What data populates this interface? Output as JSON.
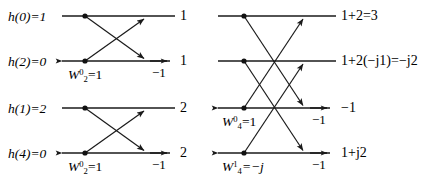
{
  "figure": {
    "stroke_color": "#1a1a1a",
    "text_color": "#000000",
    "background": "#ffffff"
  },
  "inputs": [
    {
      "id": "in-h0",
      "label": "h(0)=1",
      "name": "h(0)",
      "value": "1",
      "row": 1
    },
    {
      "id": "in-h2",
      "label": "h(2)=0",
      "name": "h(2)",
      "value": "0",
      "row": 2
    },
    {
      "id": "in-h1",
      "label": "h(1)=2",
      "name": "h(1)",
      "value": "2",
      "row": 3
    },
    {
      "id": "in-h4",
      "label": "h(4)=0",
      "name": "h(4)",
      "value": "0",
      "row": 4
    }
  ],
  "stage1": {
    "outputs": [
      {
        "id": "s1-out-1",
        "label": "1",
        "row": 1
      },
      {
        "id": "s1-out-2",
        "label": "1",
        "row": 2
      },
      {
        "id": "s1-out-3",
        "label": "2",
        "row": 3
      },
      {
        "id": "s1-out-4",
        "label": "2",
        "row": 4
      }
    ],
    "negative_labels": [
      {
        "id": "s1-neg-row2",
        "label": "−1",
        "row": 2
      },
      {
        "id": "s1-neg-row4",
        "label": "−1",
        "row": 4
      }
    ],
    "twiddles": [
      {
        "id": "s1-tw-row2",
        "base": "W",
        "sub": "2",
        "sup": "0",
        "equals": "=1",
        "row": 2
      },
      {
        "id": "s1-tw-row4",
        "base": "W",
        "sub": "2",
        "sup": "0",
        "equals": "=1",
        "row": 4
      }
    ]
  },
  "stage2": {
    "outputs": [
      {
        "id": "s2-out-1",
        "label": "1+2=3",
        "row": 1
      },
      {
        "id": "s2-out-2",
        "label": "1+2(−j1)=−j2",
        "row": 2
      },
      {
        "id": "s2-out-3",
        "label": "−1",
        "row": 3
      },
      {
        "id": "s2-out-4",
        "label": "1+j2",
        "row": 4
      }
    ],
    "negative_labels": [
      {
        "id": "s2-neg-row3",
        "label": "−1",
        "row": 3
      },
      {
        "id": "s2-neg-row4",
        "label": "−1",
        "row": 4
      }
    ],
    "twiddles": [
      {
        "id": "s2-tw-row3",
        "base": "W",
        "sub": "4",
        "sup": "0",
        "equals": "=1",
        "row": 3
      },
      {
        "id": "s2-tw-row4",
        "base": "W",
        "sub": "4",
        "sup": "1",
        "equals": "=−j",
        "row": 4
      }
    ]
  }
}
